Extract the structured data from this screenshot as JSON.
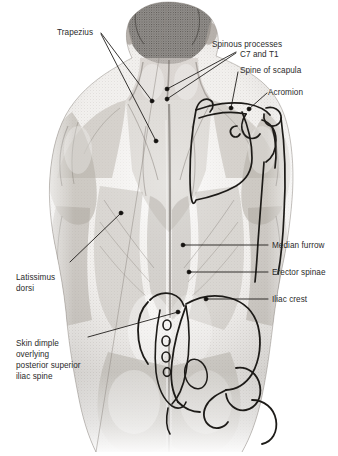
{
  "figure": {
    "view": "posterior view of male trunk",
    "background_color": "#ffffff",
    "ink_color": "#2b2b2b",
    "leader_color": "#1a1a1a",
    "skin_tone_color": "#b9b4ae",
    "hair_color": "#4a463f"
  },
  "labels": [
    {
      "id": "trapezius",
      "text": "Trapezius",
      "side": "left",
      "x": 57,
      "y": 28,
      "lines": [
        "Trapezius"
      ]
    },
    {
      "id": "spinous-processes",
      "text": "Spinous processes C7 and T1",
      "side": "right",
      "x": 212,
      "y": 40,
      "lines": [
        "Spinous processes",
        "C7 and T1"
      ]
    },
    {
      "id": "spine-of-scapula",
      "text": "Spine of scapula",
      "side": "right",
      "x": 240,
      "y": 66,
      "lines": [
        "Spine of scapula"
      ]
    },
    {
      "id": "acromion",
      "text": "Acromion",
      "side": "right",
      "x": 268,
      "y": 88,
      "lines": [
        "Acromion"
      ]
    },
    {
      "id": "median-furrow",
      "text": "Median furrow",
      "side": "right",
      "x": 272,
      "y": 241,
      "lines": [
        "Median furrow"
      ]
    },
    {
      "id": "erector-spinae",
      "text": "Erector spinae",
      "side": "right",
      "x": 272,
      "y": 268,
      "lines": [
        "Erector spinae"
      ]
    },
    {
      "id": "iliac-crest",
      "text": "Iliac crest",
      "side": "right",
      "x": 272,
      "y": 295,
      "lines": [
        "Iliac crest"
      ]
    },
    {
      "id": "latissimus-dorsi",
      "text": "Latissimus dorsi",
      "side": "left",
      "x": 16,
      "y": 273,
      "lines": [
        "Latissimus",
        "dorsi"
      ]
    },
    {
      "id": "skin-dimple",
      "text": "Skin dimple overlying posterior superior iliac spine",
      "side": "left",
      "x": 16,
      "y": 339,
      "lines": [
        "Skin dimple",
        "overlying",
        "posterior superior",
        "iliac spine"
      ]
    }
  ],
  "leaders": [
    {
      "id": "leader-trapezius-upper",
      "from": [
        101,
        33
      ],
      "to": [
        152,
        101
      ],
      "dot": true
    },
    {
      "id": "leader-trapezius-lower",
      "from": [
        101,
        34
      ],
      "to": [
        156,
        141
      ],
      "dot": true
    },
    {
      "id": "leader-spinous-c7",
      "from": [
        236,
        52
      ],
      "to": [
        167,
        89
      ],
      "dot": true
    },
    {
      "id": "leader-spinous-t1",
      "from": [
        236,
        53
      ],
      "to": [
        167,
        99
      ],
      "dot": true
    },
    {
      "id": "leader-spine-of-scapula",
      "from": [
        238,
        70
      ],
      "to": [
        231,
        108
      ],
      "dot": true
    },
    {
      "id": "leader-acromion",
      "from": [
        267,
        92
      ],
      "to": [
        248,
        109
      ],
      "dot": true
    },
    {
      "id": "leader-median-furrow",
      "from": [
        268,
        245
      ],
      "to": [
        183,
        245
      ],
      "dot": true
    },
    {
      "id": "leader-erector-spinae",
      "from": [
        268,
        272
      ],
      "to": [
        189,
        272
      ],
      "dot": true
    },
    {
      "id": "leader-iliac-crest",
      "from": [
        268,
        299
      ],
      "to": [
        205,
        299
      ],
      "dot": true
    },
    {
      "id": "leader-latissimus-dorsi",
      "from": [
        70,
        262
      ],
      "to": [
        121,
        213
      ],
      "dot": true
    },
    {
      "id": "leader-skin-dimple",
      "from": [
        88,
        337
      ],
      "to": [
        178,
        312
      ],
      "dot": true
    }
  ],
  "overlays": [
    {
      "id": "scapula-outline",
      "name": "right scapula (viewer right)"
    },
    {
      "id": "humerus-outline",
      "name": "right humerus shaft"
    },
    {
      "id": "clavicle-acromion",
      "name": "acromion and spine of scapula"
    },
    {
      "id": "pelvis-outline",
      "name": "bony pelvis, ilium and iliac crest"
    },
    {
      "id": "sacrum-outline",
      "name": "sacrum with foramina"
    },
    {
      "id": "greater-trochanter",
      "name": "greater trochanter of femur"
    }
  ]
}
